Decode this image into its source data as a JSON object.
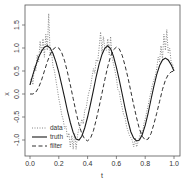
{
  "chart_data": {
    "type": "line",
    "title": "",
    "xlabel": "t",
    "ylabel": "x",
    "xlim": [
      0.0,
      1.0
    ],
    "ylim": [
      -1.25,
      1.85
    ],
    "xticks": [
      "0.0",
      "0.2",
      "0.4",
      "0.6",
      "0.8",
      "1.0"
    ],
    "yticks": [
      "-1.0",
      "-0.5",
      "0.0",
      "0.5",
      "1.0",
      "1.5"
    ],
    "grid": false,
    "legend_position": "bottom-left",
    "series": [
      {
        "name": "data",
        "style": "dotted",
        "x": [
          0.0,
          0.01,
          0.02,
          0.03,
          0.04,
          0.05,
          0.06,
          0.07,
          0.08,
          0.09,
          0.1,
          0.11,
          0.12,
          0.13,
          0.14,
          0.15,
          0.16,
          0.17,
          0.18,
          0.19,
          0.2,
          0.21,
          0.22,
          0.23,
          0.24,
          0.25,
          0.26,
          0.27,
          0.28,
          0.29,
          0.3,
          0.31,
          0.32,
          0.33,
          0.34,
          0.35,
          0.36,
          0.37,
          0.38,
          0.39,
          0.4,
          0.41,
          0.42,
          0.43,
          0.44,
          0.45,
          0.46,
          0.47,
          0.48,
          0.49,
          0.5,
          0.51,
          0.52,
          0.53,
          0.54,
          0.55,
          0.56,
          0.57,
          0.58,
          0.59,
          0.6,
          0.61,
          0.62,
          0.63,
          0.64,
          0.65,
          0.66,
          0.67,
          0.68,
          0.69,
          0.7,
          0.71,
          0.72,
          0.73,
          0.74,
          0.75,
          0.76,
          0.77,
          0.78,
          0.79,
          0.8,
          0.81,
          0.82,
          0.83,
          0.84,
          0.85,
          0.86,
          0.87,
          0.88,
          0.89,
          0.9,
          0.91,
          0.92,
          0.93,
          0.94,
          0.95,
          0.96,
          0.97,
          0.98,
          0.99,
          1.0
        ],
        "y": [
          0.2,
          0.35,
          0.2,
          0.6,
          0.5,
          0.85,
          0.7,
          1.15,
          0.9,
          1.2,
          0.8,
          1.3,
          0.95,
          1.75,
          0.85,
          0.9,
          0.6,
          0.5,
          0.3,
          0.1,
          -0.1,
          -0.25,
          -0.45,
          -0.55,
          -0.75,
          -0.7,
          -0.95,
          -0.85,
          -1.15,
          -0.9,
          -1.2,
          -0.85,
          -1.2,
          -0.9,
          -0.75,
          -0.7,
          -0.55,
          -0.65,
          -0.35,
          -0.3,
          -0.1,
          0.05,
          0.15,
          0.35,
          0.55,
          0.45,
          0.75,
          0.7,
          1.0,
          1.35,
          0.9,
          1.25,
          1.0,
          0.95,
          1.2,
          0.85,
          1.25,
          0.8,
          0.65,
          0.5,
          0.35,
          0.1,
          0.05,
          -0.15,
          -0.3,
          -0.45,
          -0.5,
          -0.7,
          -0.8,
          -0.9,
          -0.95,
          -1.0,
          -1.15,
          -0.95,
          -1.15,
          -1.05,
          -0.95,
          -0.8,
          -0.9,
          -0.65,
          -0.55,
          -0.4,
          -0.25,
          -0.1,
          0.05,
          0.2,
          0.3,
          0.4,
          0.55,
          0.8,
          0.7,
          1.05,
          0.75,
          1.3,
          0.95,
          1.4,
          0.9,
          1.0,
          0.7,
          0.65,
          0.5
        ]
      },
      {
        "name": "truth",
        "style": "solid",
        "x": [
          0.0,
          0.02,
          0.04,
          0.06,
          0.08,
          0.1,
          0.12,
          0.14,
          0.16,
          0.18,
          0.2,
          0.22,
          0.24,
          0.26,
          0.28,
          0.3,
          0.32,
          0.34,
          0.36,
          0.38,
          0.4,
          0.42,
          0.44,
          0.46,
          0.48,
          0.5,
          0.52,
          0.54,
          0.56,
          0.58,
          0.6,
          0.62,
          0.64,
          0.66,
          0.68,
          0.7,
          0.72,
          0.74,
          0.76,
          0.78,
          0.8,
          0.82,
          0.84,
          0.86,
          0.88,
          0.9,
          0.92,
          0.94,
          0.96,
          0.98,
          1.0
        ],
        "y": [
          0.2,
          0.42,
          0.62,
          0.8,
          0.93,
          1.02,
          1.05,
          1.0,
          0.88,
          0.7,
          0.47,
          0.2,
          -0.08,
          -0.36,
          -0.62,
          -0.84,
          -0.98,
          -1.0,
          -0.92,
          -0.74,
          -0.5,
          -0.22,
          0.08,
          0.38,
          0.65,
          0.86,
          1.0,
          1.05,
          0.98,
          0.82,
          0.58,
          0.3,
          0.0,
          -0.3,
          -0.58,
          -0.82,
          -0.96,
          -1.02,
          -1.0,
          -0.88,
          -0.68,
          -0.42,
          -0.12,
          0.16,
          0.42,
          0.62,
          0.74,
          0.78,
          0.74,
          0.64,
          0.5
        ]
      },
      {
        "name": "filter",
        "style": "dashed",
        "x": [
          0.0,
          0.02,
          0.04,
          0.06,
          0.08,
          0.1,
          0.12,
          0.14,
          0.16,
          0.18,
          0.2,
          0.22,
          0.24,
          0.26,
          0.28,
          0.3,
          0.32,
          0.34,
          0.36,
          0.38,
          0.4,
          0.42,
          0.44,
          0.46,
          0.48,
          0.5,
          0.52,
          0.54,
          0.56,
          0.58,
          0.6,
          0.62,
          0.64,
          0.66,
          0.68,
          0.7,
          0.72,
          0.74,
          0.76,
          0.78,
          0.8,
          0.82,
          0.84,
          0.86,
          0.88,
          0.9,
          0.92,
          0.94,
          0.96,
          0.98,
          1.0
        ],
        "y": [
          0.0,
          0.0,
          0.04,
          0.14,
          0.3,
          0.5,
          0.7,
          0.86,
          0.97,
          1.02,
          1.0,
          0.9,
          0.72,
          0.48,
          0.2,
          -0.1,
          -0.4,
          -0.66,
          -0.86,
          -0.98,
          -1.02,
          -0.96,
          -0.8,
          -0.56,
          -0.28,
          0.02,
          0.32,
          0.6,
          0.82,
          0.96,
          1.02,
          0.98,
          0.84,
          0.62,
          0.36,
          0.06,
          -0.24,
          -0.52,
          -0.76,
          -0.92,
          -1.0,
          -0.98,
          -0.86,
          -0.66,
          -0.42,
          -0.16,
          0.1,
          0.3,
          0.42,
          0.48,
          0.5
        ]
      }
    ]
  },
  "legend": {
    "items": [
      {
        "label": "data",
        "style": "dotted"
      },
      {
        "label": "truth",
        "style": "solid"
      },
      {
        "label": "filter",
        "style": "dashed"
      }
    ]
  },
  "colors": {
    "line": "#1a1a1a",
    "data_line": "#777777",
    "axis": "#555555",
    "background": "#ffffff"
  }
}
